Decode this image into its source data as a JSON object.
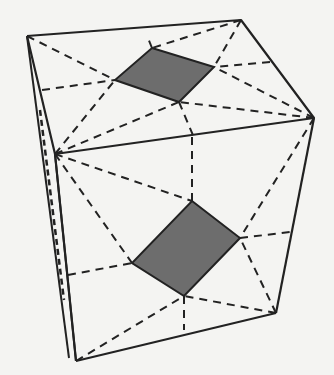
{
  "figure": {
    "colors": {
      "edge": "#222222",
      "shade": "#6d6d6d",
      "background": "#f4f4f2"
    },
    "vertices": {
      "top_back_left": [
        27,
        36
      ],
      "top_back_right": [
        241,
        20
      ],
      "top_front_right": [
        314,
        118
      ],
      "top_front_left": [
        55,
        154
      ],
      "bottom_front_left": [
        76,
        361
      ],
      "bottom_front_right": [
        276,
        313
      ],
      "bottom_back_left": [
        69,
        358
      ]
    },
    "top_quad": [
      [
        152,
        48
      ],
      [
        214,
        67
      ],
      [
        179,
        102
      ],
      [
        115,
        80
      ]
    ],
    "front_quad": [
      [
        192,
        201
      ],
      [
        240,
        238
      ],
      [
        184,
        296
      ],
      [
        132,
        263
      ]
    ]
  }
}
